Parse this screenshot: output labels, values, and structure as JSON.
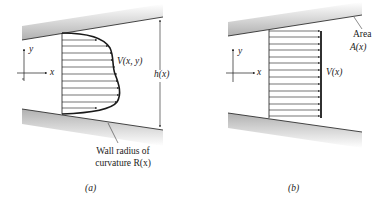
{
  "panels": [
    {
      "id": "a",
      "caption": "(a)",
      "axis": {
        "x_label": "x",
        "y_label": "y"
      },
      "velocity_label": "V(x, y)",
      "height_label": "h(x)",
      "wall_label_line1": "Wall radius of",
      "wall_label_line2": "curvature R(x)",
      "profile": "curved (nonuniform)",
      "arrow_count": 12
    },
    {
      "id": "b",
      "caption": "(b)",
      "axis": {
        "x_label": "x",
        "y_label": "y"
      },
      "velocity_label": "V(x)",
      "area_label_line1": "Area",
      "area_label_line2": "A(x)",
      "profile": "uniform",
      "arrow_count": 14
    }
  ],
  "colors": {
    "line": "#1a1a1a",
    "wall_shade": "#bdbdbd",
    "text": "#222222"
  }
}
